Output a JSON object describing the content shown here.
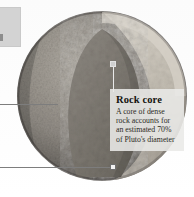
{
  "figure": {
    "background_color": "#ffffff"
  },
  "corner_panel": {
    "name": "clipped-side-panel",
    "color": "#d3d3d3"
  },
  "planet": {
    "name": "pluto-sphere",
    "surface_color": "#9a968f",
    "surface_shadow": "#5f5c57",
    "crust_color": "#cfc9bf",
    "mantle_color": "#b8b2a7",
    "core_color": "#807b73",
    "cutaway_highlight": "#d8d3c9"
  },
  "callout": {
    "title": "Rock core",
    "body_lines": [
      "A core of dense rock",
      "accounts for an",
      "estimated 70% of",
      "Pluto's diameter"
    ],
    "body_text": "A core of dense rock accounts for an estimated 70% of Pluto's diameter",
    "panel_color": "#e9e9e7",
    "title_color": "#15140f",
    "body_color": "#2b2a25"
  },
  "leaders": {
    "line_color": "#7d7d7d",
    "marker_color": "#f2f2f2",
    "items": [
      {
        "name": "leader-line-middle"
      },
      {
        "name": "leader-line-lower"
      },
      {
        "name": "leader-line-core-vertical"
      }
    ]
  }
}
